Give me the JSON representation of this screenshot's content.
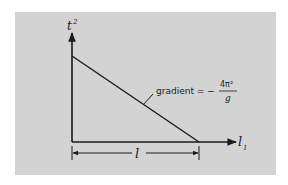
{
  "diagram": {
    "y_axis_label": "t",
    "y_axis_label_sup": "2",
    "x_axis_label": "l",
    "x_axis_label_sub": "1",
    "span_label": "l",
    "annotation": {
      "prefix": "gradient = −",
      "numerator": "4π²",
      "denominator": "g"
    },
    "colors": {
      "panel": "#d3d3d3",
      "ink": "#1a1a1a"
    }
  }
}
